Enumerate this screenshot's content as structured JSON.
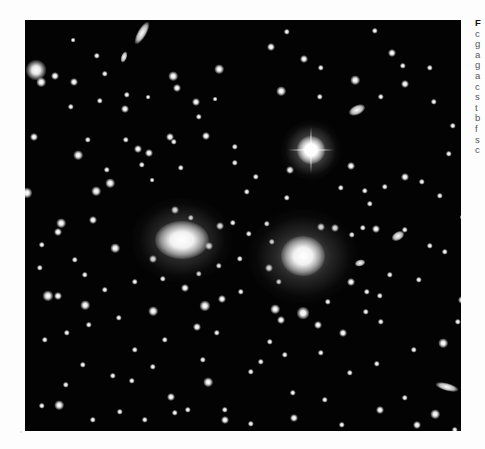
{
  "figure": {
    "type": "astronomical-photograph",
    "colors": {
      "sky": "#030303",
      "page": "#fdfdfd",
      "caption_text": "#555555"
    },
    "bright_star": {
      "x": 286,
      "y": 130,
      "core": 14,
      "halo": 60,
      "spike_len": 46
    },
    "dominant_galaxies": [
      {
        "name": "left-giant-elliptical",
        "x": 157,
        "y": 220,
        "w": 54,
        "h": 38,
        "halo": 100
      },
      {
        "name": "right-giant-elliptical",
        "x": 278,
        "y": 236,
        "w": 44,
        "h": 40,
        "halo": 110
      }
    ],
    "elongated_galaxies": [
      {
        "x": 117,
        "y": 13,
        "w": 9,
        "h": 26,
        "rot": 30
      },
      {
        "x": 332,
        "y": 90,
        "w": 18,
        "h": 10,
        "rot": -25
      },
      {
        "x": 422,
        "y": 367,
        "w": 24,
        "h": 8,
        "rot": 15
      },
      {
        "x": 99,
        "y": 37,
        "w": 6,
        "h": 12,
        "rot": 20
      },
      {
        "x": 373,
        "y": 216,
        "w": 14,
        "h": 9,
        "rot": -30
      },
      {
        "x": 335,
        "y": 243,
        "w": 11,
        "h": 7,
        "rot": -15
      }
    ],
    "sources": [
      [
        11,
        50,
        13
      ],
      [
        16,
        62,
        6
      ],
      [
        49,
        62,
        5
      ],
      [
        80,
        54,
        4
      ],
      [
        72,
        36,
        4
      ],
      [
        48,
        20,
        3
      ],
      [
        46,
        87,
        4
      ],
      [
        75,
        81,
        4
      ],
      [
        100,
        89,
        5
      ],
      [
        102,
        75,
        4
      ],
      [
        123,
        77,
        3
      ],
      [
        148,
        56,
        6
      ],
      [
        152,
        68,
        5
      ],
      [
        171,
        82,
        5
      ],
      [
        174,
        97,
        4
      ],
      [
        9,
        117,
        5
      ],
      [
        53,
        135,
        6
      ],
      [
        63,
        120,
        4
      ],
      [
        113,
        129,
        5
      ],
      [
        117,
        145,
        4
      ],
      [
        127,
        160,
        3
      ],
      [
        36,
        203,
        6
      ],
      [
        33,
        212,
        5
      ],
      [
        17,
        225,
        4
      ],
      [
        68,
        200,
        5
      ],
      [
        71,
        171,
        6
      ],
      [
        85,
        163,
        6
      ],
      [
        82,
        150,
        4
      ],
      [
        124,
        133,
        5
      ],
      [
        145,
        117,
        5
      ],
      [
        156,
        148,
        4
      ],
      [
        149,
        122,
        4
      ],
      [
        2,
        173,
        7
      ],
      [
        30,
        56,
        5
      ],
      [
        90,
        228,
        6
      ],
      [
        101,
        120,
        4
      ],
      [
        23,
        276,
        7
      ],
      [
        33,
        276,
        5
      ],
      [
        60,
        285,
        6
      ],
      [
        42,
        313,
        4
      ],
      [
        64,
        305,
        4
      ],
      [
        180,
        286,
        7
      ],
      [
        197,
        279,
        5
      ],
      [
        172,
        307,
        5
      ],
      [
        192,
        313,
        4
      ],
      [
        216,
        272,
        4
      ],
      [
        34,
        385,
        6
      ],
      [
        17,
        386,
        4
      ],
      [
        68,
        400,
        4
      ],
      [
        41,
        365,
        4
      ],
      [
        95,
        392,
        4
      ],
      [
        6,
        420,
        9
      ],
      [
        146,
        377,
        5
      ],
      [
        150,
        393,
        4
      ],
      [
        120,
        400,
        4
      ],
      [
        200,
        400,
        5
      ],
      [
        226,
        352,
        4
      ],
      [
        236,
        342,
        4
      ],
      [
        183,
        362,
        6
      ],
      [
        178,
        340,
        4
      ],
      [
        200,
        390,
        4
      ],
      [
        262,
        12,
        4
      ],
      [
        246,
        27,
        5
      ],
      [
        279,
        39,
        5
      ],
      [
        296,
        48,
        4
      ],
      [
        256,
        71,
        6
      ],
      [
        194,
        49,
        6
      ],
      [
        190,
        79,
        3
      ],
      [
        181,
        116,
        5
      ],
      [
        210,
        127,
        4
      ],
      [
        210,
        143,
        4
      ],
      [
        295,
        77,
        4
      ],
      [
        367,
        33,
        5
      ],
      [
        378,
        46,
        4
      ],
      [
        405,
        48,
        4
      ],
      [
        409,
        82,
        4
      ],
      [
        380,
        64,
        5
      ],
      [
        428,
        106,
        4
      ],
      [
        356,
        77,
        4
      ],
      [
        326,
        146,
        5
      ],
      [
        265,
        150,
        5
      ],
      [
        242,
        204,
        4
      ],
      [
        247,
        222,
        4
      ],
      [
        296,
        207,
        5
      ],
      [
        310,
        208,
        5
      ],
      [
        327,
        215,
        4
      ],
      [
        244,
        248,
        5
      ],
      [
        254,
        262,
        4
      ],
      [
        215,
        239,
        4
      ],
      [
        224,
        214,
        4
      ],
      [
        326,
        262,
        5
      ],
      [
        342,
        272,
        4
      ],
      [
        355,
        276,
        4
      ],
      [
        365,
        255,
        4
      ],
      [
        380,
        210,
        4
      ],
      [
        394,
        260,
        4
      ],
      [
        405,
        226,
        4
      ],
      [
        420,
        232,
        4
      ],
      [
        415,
        176,
        4
      ],
      [
        397,
        162,
        4
      ],
      [
        380,
        157,
        5
      ],
      [
        424,
        134,
        4
      ],
      [
        360,
        167,
        4
      ],
      [
        345,
        184,
        4
      ],
      [
        338,
        208,
        4
      ],
      [
        351,
        209,
        5
      ],
      [
        250,
        289,
        6
      ],
      [
        256,
        300,
        5
      ],
      [
        278,
        293,
        8
      ],
      [
        303,
        282,
        4
      ],
      [
        293,
        305,
        5
      ],
      [
        318,
        313,
        5
      ],
      [
        341,
        292,
        4
      ],
      [
        356,
        302,
        4
      ],
      [
        245,
        322,
        4
      ],
      [
        260,
        335,
        4
      ],
      [
        296,
        333,
        4
      ],
      [
        325,
        353,
        4
      ],
      [
        352,
        344,
        4
      ],
      [
        389,
        330,
        4
      ],
      [
        418,
        323,
        6
      ],
      [
        355,
        390,
        5
      ],
      [
        380,
        378,
        4
      ],
      [
        410,
        394,
        6
      ],
      [
        392,
        405,
        5
      ],
      [
        317,
        405,
        4
      ],
      [
        269,
        398,
        5
      ],
      [
        226,
        404,
        4
      ],
      [
        268,
        373,
        4
      ],
      [
        300,
        380,
        4
      ],
      [
        430,
        410,
        4
      ],
      [
        433,
        302,
        4
      ],
      [
        437,
        280,
        5
      ],
      [
        437,
        197,
        3
      ],
      [
        330,
        60,
        6
      ],
      [
        350,
        11,
        4
      ],
      [
        316,
        168,
        4
      ],
      [
        340,
        171,
        4
      ],
      [
        231,
        157,
        4
      ],
      [
        222,
        172,
        4
      ],
      [
        262,
        178,
        4
      ],
      [
        128,
        239,
        5
      ],
      [
        138,
        259,
        4
      ],
      [
        110,
        262,
        4
      ],
      [
        150,
        190,
        5
      ],
      [
        166,
        198,
        4
      ],
      [
        184,
        226,
        5
      ],
      [
        195,
        206,
        5
      ],
      [
        208,
        203,
        4
      ],
      [
        194,
        246,
        4
      ],
      [
        174,
        254,
        4
      ],
      [
        160,
        268,
        5
      ],
      [
        128,
        291,
        6
      ],
      [
        94,
        298,
        4
      ],
      [
        80,
        270,
        4
      ],
      [
        60,
        255,
        4
      ],
      [
        50,
        240,
        4
      ],
      [
        15,
        248,
        4
      ],
      [
        20,
        320,
        4
      ],
      [
        110,
        330,
        4
      ],
      [
        140,
        320,
        4
      ],
      [
        128,
        347,
        4
      ],
      [
        163,
        390,
        4
      ],
      [
        58,
        345,
        4
      ],
      [
        88,
        356,
        4
      ],
      [
        107,
        361,
        4
      ]
    ]
  },
  "caption": {
    "lines": [
      "F",
      "c",
      "g",
      "a",
      "g",
      "a",
      "c",
      "s",
      "t",
      "b",
      "f",
      "s",
      "c"
    ]
  }
}
